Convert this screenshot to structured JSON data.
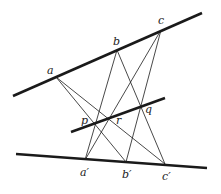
{
  "diagram": {
    "colors": {
      "line": "#1a1a1a",
      "background": "#ffffff"
    },
    "thick_lines": [
      {
        "name": "top-line",
        "x1": 13,
        "y1": 96,
        "x2": 202,
        "y2": 13
      },
      {
        "name": "middle-line",
        "x1": 71,
        "y1": 132,
        "x2": 165,
        "y2": 98
      },
      {
        "name": "bottom-line",
        "x1": 16,
        "y1": 154,
        "x2": 207,
        "y2": 168
      }
    ],
    "points": {
      "a": {
        "label": "a",
        "x": 56,
        "y": 77,
        "lx": 47,
        "ly": 74
      },
      "b": {
        "label": "b",
        "x": 117,
        "y": 50,
        "lx": 113,
        "ly": 45
      },
      "c": {
        "label": "c",
        "x": 161,
        "y": 30,
        "lx": 158,
        "ly": 24
      },
      "p": {
        "label": "p",
        "x": 95,
        "y": 123,
        "lx": 81,
        "ly": 124
      },
      "r": {
        "label": "r",
        "x": 107,
        "y": 119,
        "lx": 116,
        "ly": 124
      },
      "q": {
        "label": "q",
        "x": 142,
        "y": 106,
        "lx": 145,
        "ly": 113
      },
      "a_prime": {
        "label": "a′",
        "x": 85,
        "y": 160,
        "lx": 80,
        "ly": 176
      },
      "b_prime": {
        "label": "b′",
        "x": 126,
        "y": 162,
        "lx": 122,
        "ly": 178
      },
      "c_prime": {
        "label": "c′",
        "x": 165,
        "y": 164,
        "lx": 162,
        "ly": 180
      }
    },
    "thin_lines": [
      [
        "a",
        "b_prime"
      ],
      [
        "a",
        "c_prime"
      ],
      [
        "b",
        "a_prime"
      ],
      [
        "b",
        "c_prime"
      ],
      [
        "c",
        "a_prime"
      ],
      [
        "c",
        "b_prime"
      ]
    ]
  }
}
